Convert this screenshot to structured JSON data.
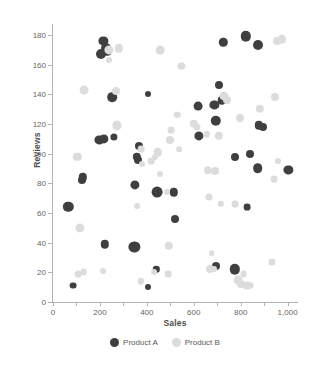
{
  "chart_data": {
    "type": "scatter",
    "title": "",
    "xlabel": "Sales",
    "ylabel": "Reviews",
    "xlim": [
      0,
      1040
    ],
    "ylim": [
      0,
      186
    ],
    "grid": false,
    "legend_position": "bottom",
    "xticks": [
      0,
      200,
      400,
      600,
      800,
      1000
    ],
    "xtick_labels": [
      "0",
      "200",
      "400",
      "600",
      "800",
      "1,000"
    ],
    "xtick_minor": [
      100,
      300,
      500,
      700,
      900
    ],
    "yticks": [
      0,
      20,
      40,
      60,
      80,
      100,
      120,
      140,
      160,
      180
    ],
    "ytick_labels": [
      "0",
      "20",
      "40",
      "60",
      "80",
      "100",
      "120",
      "140",
      "160",
      "180"
    ],
    "colors": {
      "product_a": "#3f3f3f",
      "product_b": "#dcdcdc",
      "axis": "#b3b3b3",
      "text": "#666666"
    },
    "series": [
      {
        "name": "Product A",
        "color": "#3f3f3f",
        "points": [
          {
            "x": 205,
            "y": 167,
            "r": 5.0
          },
          {
            "x": 215,
            "y": 176,
            "r": 4.6
          },
          {
            "x": 228,
            "y": 171,
            "r": 5.0
          },
          {
            "x": 232,
            "y": 169,
            "r": 4.2
          },
          {
            "x": 252,
            "y": 138,
            "r": 4.8
          },
          {
            "x": 198,
            "y": 109,
            "r": 4.6
          },
          {
            "x": 216,
            "y": 110,
            "r": 4.6
          },
          {
            "x": 258,
            "y": 111,
            "r": 3.6
          },
          {
            "x": 366,
            "y": 105,
            "r": 4.0
          },
          {
            "x": 357,
            "y": 98,
            "r": 4.2
          },
          {
            "x": 364,
            "y": 96,
            "r": 4.0
          },
          {
            "x": 404,
            "y": 140,
            "r": 3.0
          },
          {
            "x": 348,
            "y": 79,
            "r": 4.6
          },
          {
            "x": 444,
            "y": 74,
            "r": 5.4
          },
          {
            "x": 516,
            "y": 74,
            "r": 4.2
          },
          {
            "x": 518,
            "y": 56,
            "r": 4.0
          },
          {
            "x": 128,
            "y": 84,
            "r": 4.2
          },
          {
            "x": 124,
            "y": 82,
            "r": 4.0
          },
          {
            "x": 65,
            "y": 64,
            "r": 5.2
          },
          {
            "x": 222,
            "y": 39,
            "r": 4.2
          },
          {
            "x": 347,
            "y": 37,
            "r": 5.6
          },
          {
            "x": 440,
            "y": 22,
            "r": 3.2
          },
          {
            "x": 405,
            "y": 10,
            "r": 3.0
          },
          {
            "x": 85,
            "y": 11,
            "r": 3.4
          },
          {
            "x": 619,
            "y": 132,
            "r": 4.4
          },
          {
            "x": 622,
            "y": 112,
            "r": 4.6
          },
          {
            "x": 688,
            "y": 133,
            "r": 4.6
          },
          {
            "x": 694,
            "y": 122,
            "r": 5.2
          },
          {
            "x": 708,
            "y": 146,
            "r": 4.0
          },
          {
            "x": 720,
            "y": 136,
            "r": 4.2
          },
          {
            "x": 726,
            "y": 175,
            "r": 4.2
          },
          {
            "x": 821,
            "y": 179,
            "r": 5.2
          },
          {
            "x": 873,
            "y": 173,
            "r": 5.0
          },
          {
            "x": 777,
            "y": 98,
            "r": 4.0
          },
          {
            "x": 838,
            "y": 100,
            "r": 4.0
          },
          {
            "x": 872,
            "y": 90,
            "r": 4.8
          },
          {
            "x": 876,
            "y": 119,
            "r": 4.2
          },
          {
            "x": 896,
            "y": 118,
            "r": 4.0
          },
          {
            "x": 1003,
            "y": 89,
            "r": 4.6
          },
          {
            "x": 826,
            "y": 64,
            "r": 3.4
          },
          {
            "x": 694,
            "y": 24,
            "r": 4.0
          },
          {
            "x": 776,
            "y": 22,
            "r": 5.2
          }
        ]
      },
      {
        "name": "Product B",
        "color": "#dcdcdc",
        "points": [
          {
            "x": 240,
            "y": 170,
            "r": 4.6
          },
          {
            "x": 280,
            "y": 171,
            "r": 4.2
          },
          {
            "x": 455,
            "y": 170,
            "r": 4.4
          },
          {
            "x": 547,
            "y": 159,
            "r": 3.6
          },
          {
            "x": 131,
            "y": 143,
            "r": 4.4
          },
          {
            "x": 268,
            "y": 142,
            "r": 4.0
          },
          {
            "x": 274,
            "y": 119,
            "r": 4.6
          },
          {
            "x": 530,
            "y": 126,
            "r": 3.2
          },
          {
            "x": 504,
            "y": 116,
            "r": 3.4
          },
          {
            "x": 497,
            "y": 109,
            "r": 4.0
          },
          {
            "x": 446,
            "y": 101,
            "r": 4.2
          },
          {
            "x": 436,
            "y": 98,
            "r": 3.0
          },
          {
            "x": 375,
            "y": 103,
            "r": 3.4
          },
          {
            "x": 539,
            "y": 103,
            "r": 2.8
          },
          {
            "x": 104,
            "y": 98,
            "r": 4.2
          },
          {
            "x": 116,
            "y": 50,
            "r": 4.6
          },
          {
            "x": 380,
            "y": 93,
            "r": 3.0
          },
          {
            "x": 457,
            "y": 86,
            "r": 3.0
          },
          {
            "x": 600,
            "y": 120,
            "r": 4.2
          },
          {
            "x": 613,
            "y": 118,
            "r": 3.6
          },
          {
            "x": 656,
            "y": 113,
            "r": 3.2
          },
          {
            "x": 706,
            "y": 112,
            "r": 4.2
          },
          {
            "x": 727,
            "y": 139,
            "r": 4.6
          },
          {
            "x": 743,
            "y": 136,
            "r": 4.0
          },
          {
            "x": 799,
            "y": 124,
            "r": 4.0
          },
          {
            "x": 882,
            "y": 130,
            "r": 4.2
          },
          {
            "x": 946,
            "y": 138,
            "r": 4.0
          },
          {
            "x": 953,
            "y": 176,
            "r": 4.0
          },
          {
            "x": 975,
            "y": 177,
            "r": 4.2
          },
          {
            "x": 659,
            "y": 89,
            "r": 3.8
          },
          {
            "x": 692,
            "y": 88,
            "r": 4.0
          },
          {
            "x": 943,
            "y": 83,
            "r": 3.4
          },
          {
            "x": 960,
            "y": 95,
            "r": 3.0
          },
          {
            "x": 665,
            "y": 71,
            "r": 3.6
          },
          {
            "x": 715,
            "y": 66,
            "r": 3.2
          },
          {
            "x": 775,
            "y": 66,
            "r": 3.4
          },
          {
            "x": 484,
            "y": 74,
            "r": 3.0
          },
          {
            "x": 360,
            "y": 65,
            "r": 3.0
          },
          {
            "x": 494,
            "y": 38,
            "r": 4.2
          },
          {
            "x": 489,
            "y": 19,
            "r": 3.4
          },
          {
            "x": 676,
            "y": 33,
            "r": 2.8
          },
          {
            "x": 668,
            "y": 22,
            "r": 4.0
          },
          {
            "x": 686,
            "y": 22,
            "r": 3.0
          },
          {
            "x": 790,
            "y": 15,
            "r": 4.4
          },
          {
            "x": 803,
            "y": 12,
            "r": 4.0
          },
          {
            "x": 826,
            "y": 11,
            "r": 4.4
          },
          {
            "x": 812,
            "y": 19,
            "r": 3.4
          },
          {
            "x": 841,
            "y": 11,
            "r": 3.4
          },
          {
            "x": 934,
            "y": 27,
            "r": 3.6
          },
          {
            "x": 106,
            "y": 19,
            "r": 3.4
          },
          {
            "x": 130,
            "y": 20,
            "r": 3.4
          },
          {
            "x": 212,
            "y": 21,
            "r": 3.0
          },
          {
            "x": 373,
            "y": 14,
            "r": 3.2
          },
          {
            "x": 431,
            "y": 20,
            "r": 3.0
          },
          {
            "x": 240,
            "y": 163,
            "r": 3.0
          },
          {
            "x": 418,
            "y": 95,
            "r": 3.4
          }
        ]
      }
    ]
  },
  "legend": {
    "items": [
      {
        "label": "Product A",
        "color": "#3f3f3f"
      },
      {
        "label": "Product B",
        "color": "#dcdcdc"
      }
    ]
  }
}
